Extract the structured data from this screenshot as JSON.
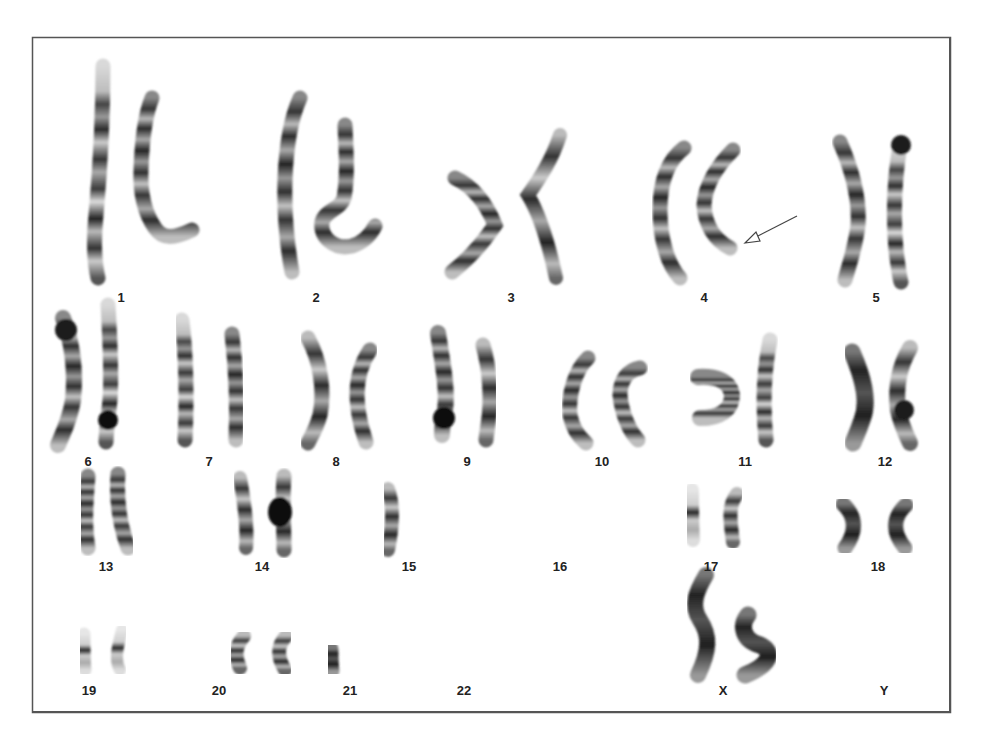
{
  "figure": {
    "type": "karyotype",
    "annotation": {
      "kind": "arrow",
      "pointing_to": "chromosome 4 (right homolog, distal q-arm)"
    },
    "labels": [
      "1",
      "2",
      "3",
      "4",
      "5",
      "6",
      "7",
      "8",
      "9",
      "10",
      "11",
      "12",
      "13",
      "14",
      "15",
      "16",
      "17",
      "18",
      "19",
      "20",
      "21",
      "22",
      "X",
      "Y"
    ]
  },
  "rows": [
    {
      "chromosomes": [
        {
          "label": "1",
          "label_x": 121,
          "label_y": 290
        },
        {
          "label": "2",
          "label_x": 316,
          "label_y": 290
        },
        {
          "label": "3",
          "label_x": 511,
          "label_y": 290
        },
        {
          "label": "4",
          "label_x": 704,
          "label_y": 290
        },
        {
          "label": "5",
          "label_x": 876,
          "label_y": 290
        }
      ]
    },
    {
      "chromosomes": [
        {
          "label": "6",
          "label_x": 88,
          "label_y": 454
        },
        {
          "label": "7",
          "label_x": 209,
          "label_y": 454
        },
        {
          "label": "8",
          "label_x": 336,
          "label_y": 454
        },
        {
          "label": "9",
          "label_x": 467,
          "label_y": 454
        },
        {
          "label": "10",
          "label_x": 602,
          "label_y": 454
        },
        {
          "label": "11",
          "label_x": 745,
          "label_y": 454
        },
        {
          "label": "12",
          "label_x": 885,
          "label_y": 454
        }
      ]
    },
    {
      "chromosomes": [
        {
          "label": "13",
          "label_x": 106,
          "label_y": 559
        },
        {
          "label": "14",
          "label_x": 262,
          "label_y": 559
        },
        {
          "label": "15",
          "label_x": 409,
          "label_y": 559
        },
        {
          "label": "16",
          "label_x": 560,
          "label_y": 559
        },
        {
          "label": "17",
          "label_x": 711,
          "label_y": 559
        },
        {
          "label": "18",
          "label_x": 878,
          "label_y": 559
        }
      ]
    },
    {
      "chromosomes": [
        {
          "label": "19",
          "label_x": 89,
          "label_y": 683
        },
        {
          "label": "20",
          "label_x": 219,
          "label_y": 683
        },
        {
          "label": "21",
          "label_x": 350,
          "label_y": 683
        },
        {
          "label": "22",
          "label_x": 464,
          "label_y": 683
        },
        {
          "label": "X",
          "label_x": 723,
          "label_y": 683
        },
        {
          "label": "Y",
          "label_x": 884,
          "label_y": 683
        }
      ]
    }
  ],
  "colors": {
    "frame": "#555555",
    "label": "#222222",
    "chromatin_dark": "#1e1e1e",
    "chromatin_light": "#d8d8d8",
    "arrow": "#444444"
  }
}
